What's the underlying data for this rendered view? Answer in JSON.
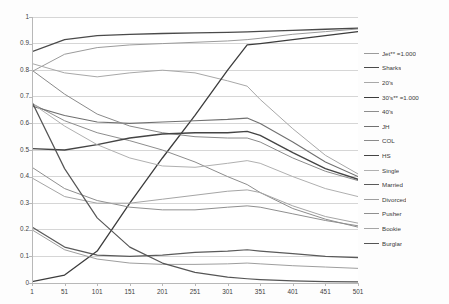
{
  "chart_data": {
    "type": "line",
    "title": "",
    "subtitle": "",
    "xlabel": "",
    "ylabel": "",
    "xlim": [
      1,
      501
    ],
    "ylim": [
      0,
      1
    ],
    "grid": "horizontal",
    "legend_position": "right",
    "x_ticks": [
      "1",
      "51",
      "101",
      "151",
      "201",
      "251",
      "301",
      "351",
      "401",
      "451",
      "501"
    ],
    "x_tick_values": [
      1,
      51,
      101,
      151,
      201,
      251,
      301,
      351,
      401,
      451,
      501
    ],
    "y_ticks": [
      "0",
      "0.1",
      "0.2",
      "0.3",
      "0.4",
      "0.5",
      "0.6",
      "0.7",
      "0.8",
      "0.9",
      "1"
    ],
    "y_tick_values": [
      0,
      0.1,
      0.2,
      0.3,
      0.4,
      0.5,
      0.6,
      0.7,
      0.8,
      0.9,
      1
    ],
    "x": [
      1,
      51,
      101,
      151,
      201,
      251,
      301,
      331,
      351,
      401,
      451,
      501
    ],
    "series": [
      {
        "name": "Jet** =1.000",
        "color": "#9b9b9b",
        "width": 1.0,
        "values": [
          0.795,
          0.86,
          0.885,
          0.895,
          0.9,
          0.905,
          0.91,
          0.915,
          0.92,
          0.935,
          0.945,
          0.955
        ]
      },
      {
        "name": "Sharks",
        "color": "#4a4a4a",
        "width": 1.3,
        "values": [
          0.87,
          0.915,
          0.93,
          0.935,
          0.938,
          0.94,
          0.942,
          0.944,
          0.946,
          0.95,
          0.954,
          0.958
        ]
      },
      {
        "name": "20's",
        "color": "#a8a8a8",
        "width": 1.0,
        "values": [
          0.825,
          0.79,
          0.775,
          0.79,
          0.8,
          0.79,
          0.76,
          0.74,
          0.69,
          0.58,
          0.48,
          0.41
        ]
      },
      {
        "name": "30's** =1.000",
        "color": "#3c3c3c",
        "width": 1.3,
        "values": [
          0.005,
          0.03,
          0.12,
          0.3,
          0.47,
          0.63,
          0.8,
          0.895,
          0.9,
          0.915,
          0.93,
          0.945
        ]
      },
      {
        "name": "40's",
        "color": "#8d8d8d",
        "width": 1.0,
        "values": [
          0.675,
          0.61,
          0.565,
          0.535,
          0.5,
          0.455,
          0.4,
          0.37,
          0.34,
          0.28,
          0.24,
          0.21
        ]
      },
      {
        "name": "JH",
        "color": "#707070",
        "width": 1.1,
        "values": [
          0.665,
          0.63,
          0.605,
          0.6,
          0.605,
          0.61,
          0.615,
          0.62,
          0.6,
          0.53,
          0.455,
          0.4
        ]
      },
      {
        "name": "COL",
        "color": "#8a8a8a",
        "width": 1.0,
        "values": [
          0.8,
          0.71,
          0.635,
          0.59,
          0.565,
          0.55,
          0.545,
          0.545,
          0.53,
          0.47,
          0.42,
          0.385
        ]
      },
      {
        "name": "HS",
        "color": "#444444",
        "width": 1.35,
        "values": [
          0.505,
          0.5,
          0.52,
          0.545,
          0.56,
          0.565,
          0.565,
          0.57,
          0.555,
          0.49,
          0.43,
          0.39
        ]
      },
      {
        "name": "Single",
        "color": "#b0b0b0",
        "width": 1.0,
        "values": [
          0.675,
          0.59,
          0.52,
          0.47,
          0.44,
          0.435,
          0.45,
          0.46,
          0.45,
          0.4,
          0.355,
          0.325
        ]
      },
      {
        "name": "Married",
        "color": "#5a5a5a",
        "width": 1.25,
        "values": [
          0.21,
          0.135,
          0.105,
          0.1,
          0.105,
          0.115,
          0.12,
          0.125,
          0.12,
          0.11,
          0.1,
          0.095
        ]
      },
      {
        "name": "Divorced",
        "color": "#9e9e9e",
        "width": 1.0,
        "values": [
          0.2,
          0.125,
          0.09,
          0.075,
          0.07,
          0.07,
          0.072,
          0.075,
          0.072,
          0.065,
          0.06,
          0.055
        ]
      },
      {
        "name": "Pusher",
        "color": "#8f8f8f",
        "width": 1.0,
        "values": [
          0.435,
          0.355,
          0.31,
          0.285,
          0.275,
          0.275,
          0.285,
          0.29,
          0.285,
          0.26,
          0.235,
          0.215
        ]
      },
      {
        "name": "Bookie",
        "color": "#a5a5a5",
        "width": 1.0,
        "values": [
          0.395,
          0.325,
          0.3,
          0.3,
          0.315,
          0.33,
          0.345,
          0.35,
          0.34,
          0.29,
          0.25,
          0.225
        ]
      },
      {
        "name": "Burglar",
        "color": "#555555",
        "width": 1.2,
        "values": [
          0.68,
          0.43,
          0.245,
          0.135,
          0.075,
          0.04,
          0.022,
          0.016,
          0.013,
          0.008,
          0.005,
          0.004
        ]
      }
    ]
  }
}
